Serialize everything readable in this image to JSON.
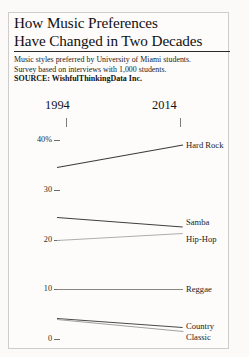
{
  "headline": {
    "line1": "How Music Preferences",
    "line2": "Have Changed in Two Decades"
  },
  "deck": {
    "line1": "Music styles preferred by University of Miami students.",
    "line2": "Survey based on interviews with 1,000 students."
  },
  "source": "SOURCE: WishfulThinkingData Inc.",
  "chart_data": {
    "type": "line",
    "title": "How Music Preferences Have Changed in Two Decades",
    "subtitle": "Music styles preferred by University of Miami students. Survey based on interviews with 1,000 students.",
    "source": "SOURCE: WishfulThinkingData Inc.",
    "xlabel": "",
    "ylabel": "",
    "x": [
      "1994",
      "2014"
    ],
    "categories": [
      "1994",
      "2014"
    ],
    "ylim": [
      0,
      42
    ],
    "yticks": [
      0,
      10,
      20,
      30,
      40
    ],
    "ytick_labels": [
      "0",
      "10",
      "20",
      "30",
      "40%"
    ],
    "grid": false,
    "legend_position": "right-inline",
    "series": [
      {
        "name": "Hard Rock",
        "values": [
          34.5,
          39.0
        ],
        "color": "#3a3a3c"
      },
      {
        "name": "Samba",
        "values": [
          24.5,
          22.6
        ],
        "color": "#3f3f41"
      },
      {
        "name": "Hip-Hop",
        "values": [
          20.0,
          21.4
        ],
        "color": "#aeadab"
      },
      {
        "name": "Reggae",
        "values": [
          10.0,
          10.0
        ],
        "color": "#87857f"
      },
      {
        "name": "Country",
        "values": [
          4.2,
          2.4
        ],
        "color": "#4a4a4c"
      },
      {
        "name": "Classic",
        "values": [
          4.0,
          1.6
        ],
        "color": "#a3a19d"
      }
    ]
  },
  "axis": {
    "year_left": "1994",
    "year_right": "2014",
    "ticks": [
      {
        "label": "40%",
        "value": 40
      },
      {
        "label": "30",
        "value": 30
      },
      {
        "label": "20",
        "value": 20
      },
      {
        "label": "10",
        "value": 10
      },
      {
        "label": "0",
        "value": 0
      }
    ]
  },
  "colors": {
    "page_background": "#fbfaf8",
    "frame": "#cfcdc9",
    "text": "#18181a",
    "rule": "#2a2a2c"
  }
}
